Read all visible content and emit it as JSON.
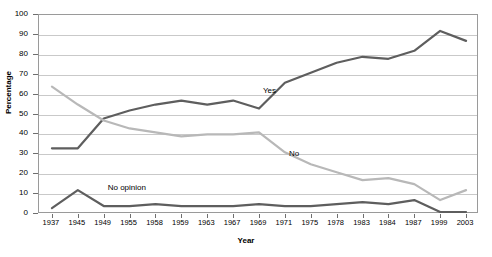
{
  "chart_data": {
    "type": "line",
    "title": "",
    "xlabel": "Year",
    "ylabel": "Percentage",
    "ylim": [
      0,
      100
    ],
    "ytick_step": 10,
    "yticks": [
      0,
      10,
      20,
      30,
      40,
      50,
      60,
      70,
      80,
      90,
      100
    ],
    "grid": true,
    "legend_position": "inline-annotations",
    "categories": [
      "1937",
      "1945",
      "1949",
      "1955",
      "1958",
      "1959",
      "1963",
      "1967",
      "1969",
      "1971",
      "1975",
      "1978",
      "1983",
      "1984",
      "1987",
      "1999",
      "2003"
    ],
    "series": [
      {
        "name": "Yes",
        "color": "#5e5e5e",
        "values": [
          33,
          33,
          48,
          52,
          55,
          57,
          55,
          57,
          53,
          66,
          71,
          76,
          79,
          78,
          82,
          92,
          87
        ]
      },
      {
        "name": "No",
        "color": "#b8b8b8",
        "values": [
          64,
          55,
          47,
          43,
          41,
          39,
          40,
          40,
          41,
          31,
          25,
          21,
          17,
          18,
          15,
          7,
          12
        ]
      },
      {
        "name": "No opinion",
        "color": "#5e5e5e",
        "values": [
          3,
          12,
          4,
          4,
          5,
          4,
          4,
          4,
          5,
          4,
          4,
          5,
          6,
          5,
          7,
          1,
          1
        ]
      }
    ],
    "annotations": [
      {
        "text": "Yes",
        "x_category": "1969",
        "value": 62
      },
      {
        "text": "No",
        "x_category": "1971",
        "value": 30
      },
      {
        "text": "No opinion",
        "x_category": "1949",
        "value": 13
      }
    ]
  }
}
